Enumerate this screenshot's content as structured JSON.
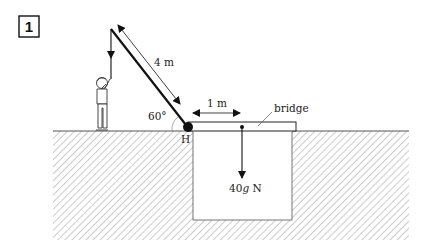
{
  "problem": {
    "number": "1"
  },
  "labels": {
    "rope_length": "4 m",
    "angle": "60°",
    "distance": "1 m",
    "bridge": "bridge",
    "hinge": "H",
    "weight_prefix": "40",
    "weight_g": "g",
    "weight_unit": " N"
  },
  "colors": {
    "ink": "#111111",
    "hatch": "#9a9a9a",
    "background": "#ffffff"
  }
}
